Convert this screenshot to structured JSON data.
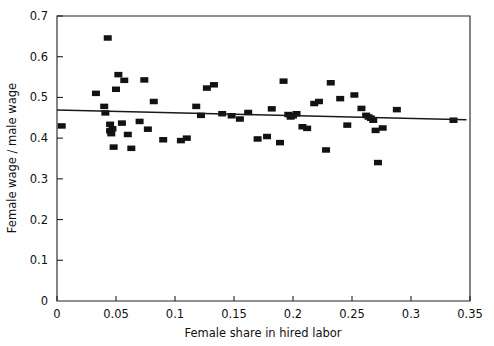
{
  "chart_data": {
    "type": "scatter",
    "title": "",
    "xlabel": "Female share in hired labor",
    "ylabel": "Female wage / male wage",
    "xlim": [
      0,
      0.35
    ],
    "ylim": [
      0,
      0.7
    ],
    "grid": false,
    "legend": null,
    "xticks": [
      0,
      0.05,
      0.1,
      0.15,
      0.2,
      0.25,
      0.3,
      0.35
    ],
    "xtick_labels": [
      "0",
      "0.05",
      "0.1",
      "0.15",
      "0.2",
      "0.25",
      "0.3",
      "0.35"
    ],
    "yticks": [
      0,
      0.1,
      0.2,
      0.3,
      0.4,
      0.5,
      0.6,
      0.7
    ],
    "ytick_labels": [
      "0",
      "0.1",
      "0.2",
      "0.3",
      "0.4",
      "0.5",
      "0.6",
      "0.7"
    ],
    "marker_style": "square",
    "marker_color": "#121212",
    "points": [
      [
        0.004,
        0.43
      ],
      [
        0.033,
        0.51
      ],
      [
        0.04,
        0.478
      ],
      [
        0.041,
        0.462
      ],
      [
        0.043,
        0.646
      ],
      [
        0.045,
        0.434
      ],
      [
        0.045,
        0.418
      ],
      [
        0.046,
        0.411
      ],
      [
        0.047,
        0.423
      ],
      [
        0.048,
        0.378
      ],
      [
        0.05,
        0.52
      ],
      [
        0.052,
        0.556
      ],
      [
        0.055,
        0.437
      ],
      [
        0.057,
        0.542
      ],
      [
        0.06,
        0.409
      ],
      [
        0.063,
        0.375
      ],
      [
        0.07,
        0.441
      ],
      [
        0.074,
        0.543
      ],
      [
        0.077,
        0.422
      ],
      [
        0.082,
        0.49
      ],
      [
        0.09,
        0.396
      ],
      [
        0.105,
        0.394
      ],
      [
        0.11,
        0.4
      ],
      [
        0.118,
        0.478
      ],
      [
        0.122,
        0.456
      ],
      [
        0.127,
        0.523
      ],
      [
        0.133,
        0.531
      ],
      [
        0.14,
        0.46
      ],
      [
        0.148,
        0.455
      ],
      [
        0.155,
        0.447
      ],
      [
        0.162,
        0.463
      ],
      [
        0.17,
        0.398
      ],
      [
        0.178,
        0.404
      ],
      [
        0.182,
        0.472
      ],
      [
        0.189,
        0.389
      ],
      [
        0.192,
        0.54
      ],
      [
        0.196,
        0.458
      ],
      [
        0.198,
        0.452
      ],
      [
        0.2,
        0.455
      ],
      [
        0.203,
        0.46
      ],
      [
        0.208,
        0.428
      ],
      [
        0.212,
        0.424
      ],
      [
        0.218,
        0.485
      ],
      [
        0.222,
        0.49
      ],
      [
        0.228,
        0.371
      ],
      [
        0.232,
        0.536
      ],
      [
        0.24,
        0.497
      ],
      [
        0.246,
        0.432
      ],
      [
        0.252,
        0.506
      ],
      [
        0.258,
        0.473
      ],
      [
        0.262,
        0.456
      ],
      [
        0.264,
        0.452
      ],
      [
        0.266,
        0.449
      ],
      [
        0.268,
        0.444
      ],
      [
        0.27,
        0.419
      ],
      [
        0.272,
        0.34
      ],
      [
        0.276,
        0.425
      ],
      [
        0.288,
        0.47
      ],
      [
        0.336,
        0.444
      ]
    ],
    "trendline": {
      "x": [
        0.0,
        0.347
      ],
      "y": [
        0.469,
        0.445
      ],
      "color": "#1a1a1a"
    }
  }
}
